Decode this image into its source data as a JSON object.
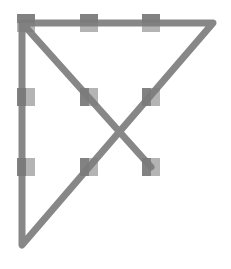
{
  "diagram": {
    "colors": {
      "background": "#ffffff",
      "dot_light": "#b4b4b4",
      "dot_dark": "#5a5a5a",
      "line": "#7a7a7a"
    },
    "dots": [
      {
        "row": 0,
        "col": 0,
        "x": 26,
        "y": 23
      },
      {
        "row": 0,
        "col": 1,
        "x": 89,
        "y": 23
      },
      {
        "row": 0,
        "col": 2,
        "x": 151,
        "y": 23
      },
      {
        "row": 1,
        "col": 0,
        "x": 26,
        "y": 97
      },
      {
        "row": 1,
        "col": 1,
        "x": 89,
        "y": 97
      },
      {
        "row": 1,
        "col": 2,
        "x": 151,
        "y": 97
      },
      {
        "row": 2,
        "col": 0,
        "x": 26,
        "y": 167
      },
      {
        "row": 2,
        "col": 1,
        "x": 89,
        "y": 167
      },
      {
        "row": 2,
        "col": 2,
        "x": 151,
        "y": 167
      }
    ],
    "dot_size": 18,
    "path": [
      {
        "x": 151,
        "y": 167
      },
      {
        "x": 22,
        "y": 23
      },
      {
        "x": 213,
        "y": 23
      },
      {
        "x": 22,
        "y": 245
      },
      {
        "x": 22,
        "y": 23
      }
    ],
    "line_width": 7
  }
}
